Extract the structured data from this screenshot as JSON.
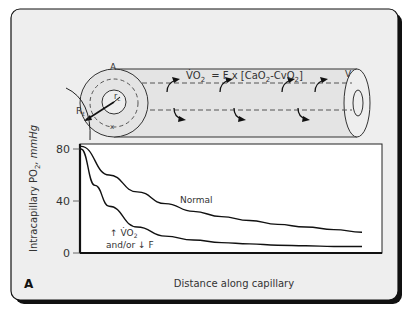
{
  "panel_label": "A",
  "diagram": {
    "equation": {
      "lhs": "V̇O",
      "lhs_sub": "2",
      "rhs": "= F x [CaO",
      "rhs_sub1": "2",
      "rhs_mid": "-CvO",
      "rhs_sub2": "2",
      "rhs_end": "]"
    },
    "labels": {
      "artery_zone": "A",
      "venous_end": "V",
      "radius_outer": "R",
      "radius_outer_sub": "t",
      "radius_capillary": "r",
      "radius_capillary_sub": "c",
      "point_x": "x"
    }
  },
  "chart_data": {
    "type": "line",
    "title": "",
    "xlabel": "Distance along capillary",
    "ylabel": "Intracapillary PO2, mmHg",
    "ylabel_parts": {
      "main": "Intracapillary PO",
      "sub": "2",
      "unit": ", mmHg"
    },
    "yticks": [
      0,
      40,
      80
    ],
    "ylim": [
      0,
      80
    ],
    "xlim": [
      0,
      1
    ],
    "grid": false,
    "series": [
      {
        "name": "Normal",
        "x": [
          0,
          0.1,
          0.2,
          0.3,
          0.4,
          0.5,
          0.6,
          0.7,
          0.8,
          0.9,
          1.0
        ],
        "values": [
          82,
          60,
          47,
          38,
          32,
          28,
          25,
          22,
          20,
          18,
          16
        ]
      },
      {
        "name": "↑ V̇O2 and/or ↓ F",
        "label_line1": "↑ V̇O",
        "label_line1_sub": "2",
        "label_line2": "and/or ↓ F",
        "x": [
          0,
          0.05,
          0.1,
          0.2,
          0.3,
          0.4,
          0.5,
          0.6,
          0.7,
          0.8,
          0.9,
          1.0
        ],
        "values": [
          80,
          52,
          36,
          20,
          13,
          10,
          8,
          7,
          6,
          5.5,
          5,
          5
        ]
      }
    ]
  }
}
